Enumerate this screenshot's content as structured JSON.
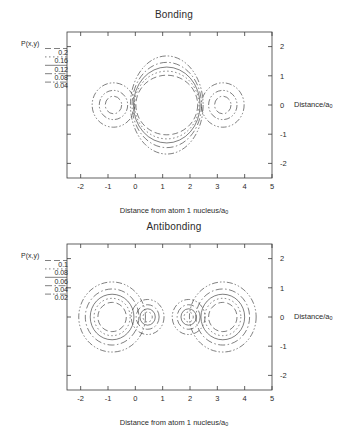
{
  "figure": {
    "background": "#ffffff",
    "line_color": "#3a3a3a"
  },
  "axis": {
    "xlabel": "Distance from atom 1 nucleus/a",
    "xlabel_sub": "0",
    "ylabel": "Distance/a",
    "ylabel_sub": "0",
    "xticks": [
      "-2",
      "-1",
      "0",
      "1",
      "2",
      "3",
      "4",
      "5"
    ],
    "yticks": [
      "2",
      "1",
      "0",
      "-1",
      "-2"
    ],
    "xlim": [
      -2.5,
      5.0
    ],
    "ylim": [
      -2.5,
      2.5
    ]
  },
  "panels": [
    {
      "id": "bonding",
      "title": "Bonding",
      "legend_title": "P(x,y)",
      "levels": [
        "0.2",
        "0.16",
        "0.12",
        "0.08",
        "0.04"
      ]
    },
    {
      "id": "antibonding",
      "title": "Antibonding",
      "legend_title": "P(x,y)",
      "levels": [
        "0.1",
        "0.08",
        "0.06",
        "0.04",
        "0.02"
      ]
    }
  ],
  "chart_data": {
    "type": "contour",
    "xlabel": "Distance from atom 1 nucleus/a0",
    "ylabel": "Distance/a0",
    "xlim": [
      -2.5,
      5.0
    ],
    "ylim": [
      -2.5,
      2.5
    ],
    "grid": false,
    "legend_position": "outside-left",
    "nuclei_positions_x": [
      0.0,
      2.3
    ],
    "panels": [
      {
        "name": "Bonding",
        "quantity": "P(x,y)",
        "levels": [
          0.2,
          0.16,
          0.12,
          0.08,
          0.04
        ],
        "dash_patterns": [
          "6,3",
          "1.5,2.5",
          "none",
          "7,2.5,1.5,2.5",
          "6,2,1.5,2,1.5,2"
        ],
        "description": "Sigma bonding orbital: large merged central density envelope spanning both nuclei plus two small satellite rings outside the nuclei",
        "contours": [
          {
            "level": 0.2,
            "shapes": [
              {
                "cx": 1.15,
                "cy": 0,
                "rx": 1.13,
                "ry": 1.02
              }
            ]
          },
          {
            "level": 0.16,
            "shapes": [
              {
                "cx": 1.15,
                "cy": 0,
                "rx": 1.18,
                "ry": 1.16
              }
            ]
          },
          {
            "level": 0.12,
            "shapes": [
              {
                "cx": 1.15,
                "cy": 0,
                "rx": 1.22,
                "ry": 1.3
              }
            ]
          },
          {
            "level": 0.08,
            "shapes": [
              {
                "cx": 1.15,
                "cy": 0,
                "rx": 1.27,
                "ry": 1.46
              },
              {
                "cx": -0.8,
                "cy": 0,
                "rx": 0.3,
                "ry": 0.3
              },
              {
                "cx": 3.2,
                "cy": 0,
                "rx": 0.3,
                "ry": 0.3
              }
            ]
          },
          {
            "level": 0.04,
            "shapes": [
              {
                "cx": 1.15,
                "cy": 0,
                "rx": 1.33,
                "ry": 1.68
              },
              {
                "cx": -0.8,
                "cy": 0,
                "rx": 0.52,
                "ry": 0.5
              },
              {
                "cx": 3.2,
                "cy": 0,
                "rx": 0.52,
                "ry": 0.5
              },
              {
                "cx": -0.8,
                "cy": 0,
                "rx": 0.78,
                "ry": 0.76
              },
              {
                "cx": 3.2,
                "cy": 0,
                "rx": 0.78,
                "ry": 0.76
              }
            ]
          }
        ]
      },
      {
        "name": "Antibonding",
        "quantity": "P(x,y)",
        "levels": [
          0.1,
          0.08,
          0.06,
          0.04,
          0.02
        ],
        "dash_patterns": [
          "6,3",
          "1.5,2.5",
          "none",
          "7,2.5,1.5,2.5",
          "6,2,1.5,2,1.5,2"
        ],
        "description": "Sigma-star antibonding orbital: two large lobes centred outside the nuclei and two smaller inner lobes, separated by a nodal plane midway between the nuclei",
        "contours": [
          {
            "level": 0.1,
            "shapes": [
              {
                "cx": -0.85,
                "cy": 0,
                "rx": 0.52,
                "ry": 0.5
              },
              {
                "cx": 3.2,
                "cy": 0,
                "rx": 0.52,
                "ry": 0.5
              }
            ]
          },
          {
            "level": 0.08,
            "shapes": [
              {
                "cx": -0.85,
                "cy": 0,
                "rx": 0.66,
                "ry": 0.64
              },
              {
                "cx": 3.2,
                "cy": 0,
                "rx": 0.66,
                "ry": 0.64
              },
              {
                "cx": 0.45,
                "cy": 0,
                "rx": 0.17,
                "ry": 0.17
              },
              {
                "cx": 1.95,
                "cy": 0,
                "rx": 0.17,
                "ry": 0.17
              }
            ]
          },
          {
            "level": 0.06,
            "shapes": [
              {
                "cx": -0.85,
                "cy": 0,
                "rx": 0.8,
                "ry": 0.78
              },
              {
                "cx": 3.2,
                "cy": 0,
                "rx": 0.8,
                "ry": 0.78
              },
              {
                "cx": 0.45,
                "cy": 0,
                "rx": 0.28,
                "ry": 0.28
              },
              {
                "cx": 1.95,
                "cy": 0,
                "rx": 0.28,
                "ry": 0.28
              }
            ]
          },
          {
            "level": 0.04,
            "shapes": [
              {
                "cx": -0.85,
                "cy": 0,
                "rx": 0.98,
                "ry": 0.96
              },
              {
                "cx": 3.2,
                "cy": 0,
                "rx": 0.98,
                "ry": 0.96
              },
              {
                "cx": 0.45,
                "cy": 0,
                "rx": 0.42,
                "ry": 0.42
              },
              {
                "cx": 1.95,
                "cy": 0,
                "rx": 0.42,
                "ry": 0.42
              }
            ]
          },
          {
            "level": 0.02,
            "shapes": [
              {
                "cx": -0.85,
                "cy": 0,
                "rx": 1.22,
                "ry": 1.2
              },
              {
                "cx": 3.2,
                "cy": 0,
                "rx": 1.22,
                "ry": 1.2
              },
              {
                "cx": 0.45,
                "cy": 0,
                "rx": 0.6,
                "ry": 0.6
              },
              {
                "cx": 1.95,
                "cy": 0,
                "rx": 0.6,
                "ry": 0.6
              }
            ]
          }
        ]
      }
    ]
  }
}
